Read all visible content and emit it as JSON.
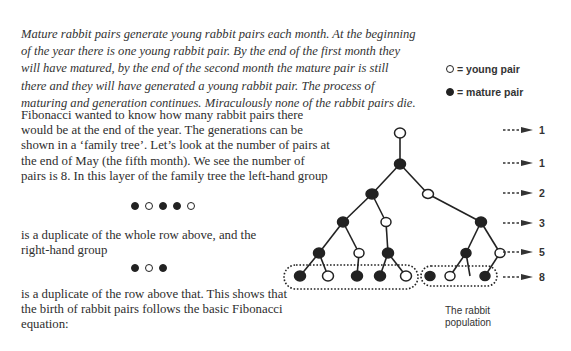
{
  "intro": {
    "text": "Mature rabbit pairs generate young rabbit pairs each month. At the beginning of the year there is one young rabbit pair. By the end of the first month they will have matured, by the end of the second month the mature pair is still there and they will have generated a young rabbit pair. The process of maturing and generation continues. Miraculously none of the rabbit pairs die."
  },
  "legend": {
    "young": "= young pair",
    "mature": "= mature pair"
  },
  "body": {
    "para1": "Fibonacci wanted to know how many rabbit pairs there would be at the end of the year. The generations can be shown in a ‘family tree’. Let’s look at the number of pairs at the end of May (the fifth month). We see the number of pairs is 8. In this layer of the family tree the left-hand group",
    "para2": "is a duplicate of the whole row above, and the right-hand group",
    "para3": "is a duplicate of the row above that. This shows that the birth of rabbit pairs follows the basic Fibonacci equation:"
  },
  "left_group": [
    "mature",
    "young",
    "mature",
    "mature",
    "young"
  ],
  "right_group": [
    "mature",
    "young",
    "mature"
  ],
  "row_counts": [
    "1",
    "1",
    "2",
    "3",
    "5",
    "8"
  ],
  "caption": "The rabbit population",
  "colors": {
    "ink": "#222222",
    "text": "#2e2e2e"
  }
}
